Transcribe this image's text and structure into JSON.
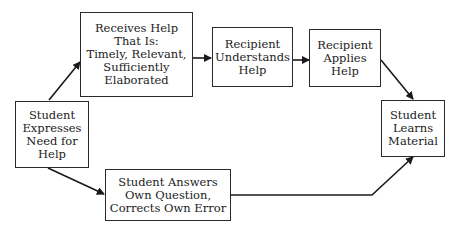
{
  "diagram": {
    "nodes": [
      {
        "id": "expresses_need",
        "label": "Student\nExpresses\nNeed for\nHelp"
      },
      {
        "id": "receives_help",
        "label": "Receives Help\nThat Is:\nTimely, Relevant,\nSufficiently\nElaborated"
      },
      {
        "id": "understands_help",
        "label": "Recipient\nUnderstands\nHelp"
      },
      {
        "id": "applies_help",
        "label": "Recipient\nApplies\nHelp"
      },
      {
        "id": "learns_material",
        "label": "Student\nLearns\nMaterial"
      },
      {
        "id": "answers_own",
        "label": "Student Answers\nOwn Question,\nCorrects Own Error"
      }
    ],
    "edges": [
      {
        "from": "expresses_need",
        "to": "receives_help"
      },
      {
        "from": "receives_help",
        "to": "understands_help"
      },
      {
        "from": "understands_help",
        "to": "applies_help"
      },
      {
        "from": "applies_help",
        "to": "learns_material"
      },
      {
        "from": "expresses_need",
        "to": "answers_own"
      },
      {
        "from": "answers_own",
        "to": "learns_material"
      }
    ]
  }
}
